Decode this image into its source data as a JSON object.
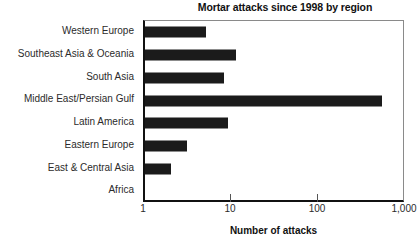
{
  "chart_data": {
    "type": "bar",
    "orientation": "horizontal",
    "title": "Mortar attacks since 1998 by region",
    "xlabel": "Number of attacks",
    "ylabel": "",
    "xscale": "log",
    "xlim": [
      1,
      1000
    ],
    "xticks": [
      1,
      10,
      100,
      1000
    ],
    "xtick_labels": [
      "1",
      "10",
      "100",
      "1,000"
    ],
    "grid": false,
    "legend": null,
    "bar_color": "#1b1b1b",
    "categories": [
      "Western Europe",
      "Southeast Asia & Oceania",
      "South Asia",
      "Middle East/Persian Gulf",
      "Latin America",
      "Eastern Europe",
      "East & Central Asia",
      "Africa"
    ],
    "values": [
      5,
      11,
      8,
      530,
      9,
      3,
      2,
      0
    ]
  },
  "chart": {
    "title": "Mortar attacks since 1998 by region",
    "x_axis_title": "Number of attacks",
    "tick_labels": [
      "1",
      "10",
      "100",
      "1,000"
    ],
    "rows": [
      {
        "label": "Western Europe",
        "value": 5
      },
      {
        "label": "Southeast Asia & Oceania",
        "value": 11
      },
      {
        "label": "South Asia",
        "value": 8
      },
      {
        "label": "Middle East/Persian Gulf",
        "value": 530
      },
      {
        "label": "Latin America",
        "value": 9
      },
      {
        "label": "Eastern Europe",
        "value": 3
      },
      {
        "label": "East & Central Asia",
        "value": 2
      },
      {
        "label": "Africa",
        "value": 0
      }
    ]
  }
}
